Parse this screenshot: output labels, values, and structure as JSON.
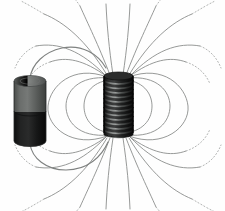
{
  "figure": {
    "title": "Magnetic field of a current-carrying solenoid connected to a battery",
    "background_color": "#fefefe",
    "width": 225,
    "height": 211
  },
  "battery": {
    "label": "battery",
    "top_section_label": "battery-upper-casing",
    "bottom_section_label": "battery-lower-casing",
    "top_color": "#5e615f",
    "top_cap_color": "#6e716f",
    "bottom_color": "#191a1a",
    "outline_color": "#2a2b2b",
    "center_x": 30,
    "center_y": 111,
    "width": 32,
    "height": 70,
    "split_fraction": 0.42
  },
  "solenoid": {
    "label": "solenoid-coil",
    "body_color": "#1b1c1c",
    "winding_highlight_color": "#8e9190",
    "winding_shadow_color": "#070707",
    "outline_color": "#0d0d0d",
    "center_x": 118,
    "center_y": 106,
    "width": 29,
    "height": 60,
    "turns": 13
  },
  "field": {
    "label": "magnetic-field-lines",
    "line_color": "#8b8d8c",
    "dotted_color": "#a9abaa",
    "line_width": 0.9,
    "dash_pattern": "1.2 2.2",
    "north_pole": "top",
    "south_pole": "bottom",
    "loop_count_per_side": 7
  },
  "wires": {
    "label": "connecting-wires",
    "color": "#7f8281",
    "line_width": 1.2,
    "top_terminal_label": "battery-top-terminal-wire",
    "bottom_terminal_label": "battery-bottom-terminal-wire"
  }
}
